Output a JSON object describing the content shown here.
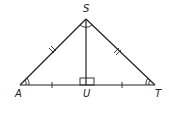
{
  "diagram": {
    "type": "isosceles-triangle",
    "vertices": {
      "S": "S",
      "A": "A",
      "T": "T",
      "U": "U"
    },
    "segments": [
      "SA",
      "ST",
      "AT",
      "SU"
    ],
    "marks": {
      "congruent_sides": [
        "SA",
        "ST"
      ],
      "congruent_segments": [
        "AU",
        "UT"
      ],
      "congruent_angles": [
        "A",
        "T"
      ],
      "angle_at_S_marked": true,
      "right_angle_at": "U"
    },
    "colors": {
      "stroke": "#222222",
      "background": "#ffffff"
    }
  }
}
